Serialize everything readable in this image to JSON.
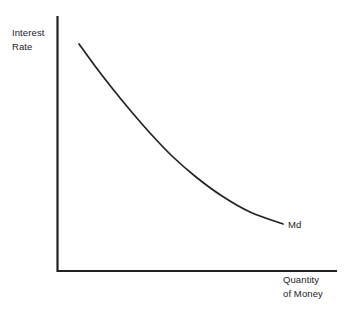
{
  "figure": {
    "background_color": "#ffffff",
    "ink_color": "#23211f",
    "width": 354,
    "height": 315
  },
  "axes": {
    "y_axis": {
      "label_line1": "Interest",
      "label_line2": "Rate",
      "x": 57,
      "y_top": 16,
      "y_bottom": 272
    },
    "x_axis": {
      "label_line1": "Quantity",
      "label_line2": "of Money",
      "y": 271,
      "x_left": 57,
      "x_right": 337
    }
  },
  "curve": {
    "label": "Md",
    "name": "money-demand-curve"
  },
  "chart_data": {
    "type": "line",
    "title": "",
    "xlabel": "Quantity of Money",
    "ylabel": "Interest Rate",
    "grid": false,
    "legend": "inline-end-label",
    "axis_ticks": [],
    "xlim": [
      0,
      100
    ],
    "ylim": [
      0,
      100
    ],
    "series": [
      {
        "name": "Md",
        "label": "Md",
        "annotation": "Md",
        "color": "#23211f",
        "x": [
          8,
          16,
          24,
          32,
          40,
          48,
          56,
          64,
          72,
          80,
          88,
          96,
          100
        ],
        "y": [
          89,
          80,
          71,
          64,
          57,
          51,
          45,
          40,
          35,
          31,
          27,
          24,
          22
        ]
      }
    ],
    "points_px": [
      [
        79,
        44
      ],
      [
        95,
        66
      ],
      [
        112,
        88
      ],
      [
        130,
        110
      ],
      [
        150,
        133
      ],
      [
        172,
        156
      ],
      [
        196,
        177
      ],
      [
        222,
        196
      ],
      [
        250,
        212
      ],
      [
        283,
        224
      ]
    ]
  }
}
